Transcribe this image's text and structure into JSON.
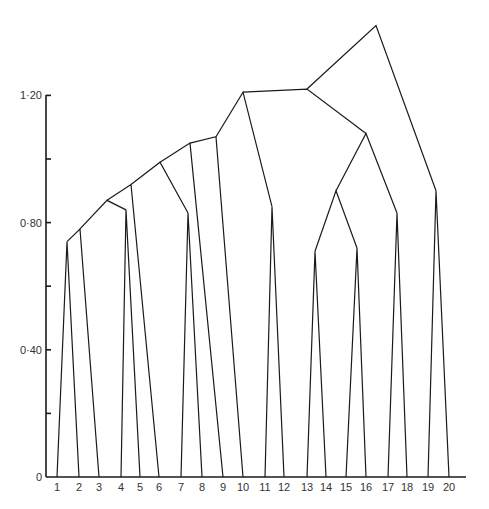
{
  "chart_data": {
    "type": "dendrogram",
    "title": "",
    "xlabel": "",
    "ylabel": "",
    "ylim": [
      0,
      1.45
    ],
    "y_ticks": [
      {
        "value": 0,
        "label": "0"
      },
      {
        "value": 0.2,
        "label": ""
      },
      {
        "value": 0.4,
        "label": "0·40"
      },
      {
        "value": 0.6,
        "label": ""
      },
      {
        "value": 0.8,
        "label": "0·80"
      },
      {
        "value": 1.0,
        "label": ""
      },
      {
        "value": 1.2,
        "label": "1·20"
      }
    ],
    "leaves": [
      "1",
      "2",
      "3",
      "4",
      "5",
      "6",
      "7",
      "8",
      "9",
      "10",
      "11",
      "12",
      "13",
      "14",
      "15",
      "16",
      "17",
      "18",
      "19",
      "20"
    ],
    "leaf_x": [
      57,
      79,
      99,
      121,
      140,
      159,
      181,
      202,
      223,
      243,
      265,
      284,
      307,
      326,
      346,
      366,
      388,
      407,
      428,
      449
    ],
    "merges": [
      {
        "id": "n1",
        "left": "1",
        "right": "2",
        "height": 0.74,
        "x": 67
      },
      {
        "id": "n2",
        "left": "n1",
        "right": "3",
        "height": 0.78,
        "x": 80
      },
      {
        "id": "n3",
        "left": "4",
        "right": "5",
        "height": 0.84,
        "x": 126
      },
      {
        "id": "n4",
        "left": "n2",
        "right": "n3",
        "height": 0.87,
        "x": 107
      },
      {
        "id": "n5",
        "left": "n4",
        "right": "6",
        "height": 0.92,
        "x": 131
      },
      {
        "id": "n6",
        "left": "7",
        "right": "8",
        "height": 0.83,
        "x": 188
      },
      {
        "id": "n7",
        "left": "n5",
        "right": "n6",
        "height": 0.99,
        "x": 160
      },
      {
        "id": "n8",
        "left": "n7",
        "right": "9",
        "height": 1.05,
        "x": 190
      },
      {
        "id": "n9",
        "left": "n8",
        "right": "10",
        "height": 1.07,
        "x": 216
      },
      {
        "id": "n10",
        "left": "11",
        "right": "12",
        "height": 0.85,
        "x": 272
      },
      {
        "id": "n11",
        "left": "n9",
        "right": "n10",
        "height": 1.21,
        "x": 243
      },
      {
        "id": "n12",
        "left": "13",
        "right": "14",
        "height": 0.71,
        "x": 315
      },
      {
        "id": "n13",
        "left": "15",
        "right": "16",
        "height": 0.72,
        "x": 357
      },
      {
        "id": "n14",
        "left": "n12",
        "right": "n13",
        "height": 0.9,
        "x": 336
      },
      {
        "id": "n15",
        "left": "17",
        "right": "18",
        "height": 0.83,
        "x": 397
      },
      {
        "id": "n16",
        "left": "n14",
        "right": "n15",
        "height": 1.08,
        "x": 366
      },
      {
        "id": "n17",
        "left": "n11",
        "right": "n16",
        "height": 1.22,
        "x": 307
      },
      {
        "id": "n18",
        "left": "19",
        "right": "20",
        "height": 0.9,
        "x": 436
      },
      {
        "id": "root",
        "left": "n17",
        "right": "n18",
        "height": 1.42,
        "x": 376
      }
    ],
    "grid": false,
    "legend": null
  },
  "layout": {
    "axis_x": 46,
    "baseline_y": 477,
    "px_per_unit": 318,
    "axis_top_y": 95,
    "baseline_end_x": 466,
    "label_y": 491,
    "line_color": "#1a1a1a"
  }
}
